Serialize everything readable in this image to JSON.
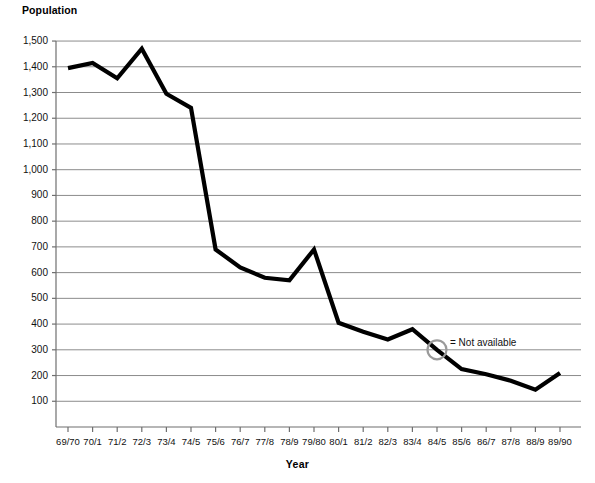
{
  "chart_data": {
    "type": "line",
    "title": "",
    "ylabel": "Population",
    "xlabel": "Year",
    "grid": true,
    "legend_position": "none",
    "ylim": [
      0,
      1500
    ],
    "ytick_step": 100,
    "ytick_labels": [
      "1,500",
      "1,400",
      "1,300",
      "1,200",
      "1,100",
      "1,000",
      "900",
      "800",
      "700",
      "600",
      "500",
      "400",
      "300",
      "200",
      "100"
    ],
    "ytick_values": [
      1500,
      1400,
      1300,
      1200,
      1100,
      1000,
      900,
      800,
      700,
      600,
      500,
      400,
      300,
      200,
      100
    ],
    "categories": [
      "69/70",
      "70/1",
      "71/2",
      "72/3",
      "73/4",
      "74/5",
      "75/6",
      "76/7",
      "77/8",
      "78/9",
      "79/80",
      "80/1",
      "81/2",
      "82/3",
      "83/4",
      "84/5",
      "85/6",
      "86/7",
      "87/8",
      "88/9",
      "89/90"
    ],
    "values": [
      1395,
      1415,
      1355,
      1470,
      1295,
      1240,
      690,
      620,
      580,
      570,
      690,
      405,
      370,
      340,
      380,
      300,
      225,
      205,
      180,
      145,
      210
    ],
    "series": [
      {
        "name": "Population",
        "values": [
          1395,
          1415,
          1355,
          1470,
          1295,
          1240,
          690,
          620,
          580,
          570,
          690,
          405,
          370,
          340,
          380,
          300,
          225,
          205,
          180,
          145,
          210
        ],
        "color": "#000000"
      }
    ],
    "annotations": [
      {
        "name": "not-available-marker",
        "category": "84/5",
        "value": 300,
        "marker": "circle-open",
        "marker_color": "#9a9a9a",
        "label": "= Not available"
      }
    ],
    "colors": {
      "line": "#000000",
      "grid": "#8c8c8c",
      "axis": "#6f6f6f",
      "marker": "#9a9a9a",
      "text": "#111111",
      "background": "#ffffff"
    }
  }
}
